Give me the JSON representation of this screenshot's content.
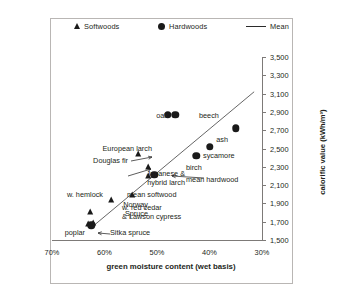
{
  "legend": {
    "items": [
      {
        "label": "Softwoods",
        "marker": "triangle-icon"
      },
      {
        "label": "Hardwoods",
        "marker": "circle-icon"
      },
      {
        "label": "Mean",
        "marker": "line-icon"
      }
    ]
  },
  "chart_data": {
    "type": "scatter",
    "title": "",
    "xlabel": "green moisture content (wet basis)",
    "ylabel": "calorific value (kWh/m³)",
    "xlim": [
      70,
      30
    ],
    "ylim": [
      1500,
      3500
    ],
    "x_ticks": [
      "70%",
      "60%",
      "50%",
      "40%",
      "30%"
    ],
    "x_tick_values": [
      70,
      60,
      50,
      40,
      30
    ],
    "y_ticks": [
      "1,500",
      "1,700",
      "1,900",
      "2,100",
      "2,300",
      "2,500",
      "2,700",
      "2,900",
      "3,100",
      "3,300",
      "3,500"
    ],
    "y_tick_values": [
      1500,
      1700,
      1900,
      2100,
      2300,
      2500,
      2700,
      2900,
      3100,
      3300,
      3500
    ],
    "grid": false,
    "legend_position": "top",
    "series": [
      {
        "name": "Softwoods",
        "marker": "triangle",
        "points": [
          {
            "label": "European larch",
            "x": 53.5,
            "y": 2430
          },
          {
            "label": "Douglas fir",
            "x": 51.5,
            "y": 2290
          },
          {
            "label": "Japanese & hybrid larch",
            "x": 51.5,
            "y": 2190
          },
          {
            "label": "mean softwood",
            "x": 54.5,
            "y": 1980
          },
          {
            "label": "w. hemlock",
            "x": 58.5,
            "y": 1930
          },
          {
            "label": "Norway Spruce",
            "x": 62.5,
            "y": 1800
          },
          {
            "label": "Sitka spruce",
            "x": 62.0,
            "y": 1680
          },
          {
            "label": "w. red cedar & Lawson cypress",
            "x": 63.0,
            "y": 1660
          }
        ]
      },
      {
        "name": "Hardwoods",
        "marker": "circle",
        "points": [
          {
            "label": "oak",
            "x": 48.0,
            "y": 2870
          },
          {
            "label": "beech",
            "x": 46.5,
            "y": 2870
          },
          {
            "label": "ash",
            "x": 35.0,
            "y": 2720
          },
          {
            "label": "sycamore",
            "x": 40.0,
            "y": 2520
          },
          {
            "label": "birch",
            "x": 42.5,
            "y": 2420
          },
          {
            "label": "mean hardwood",
            "x": 50.5,
            "y": 2210
          },
          {
            "label": "poplar",
            "x": 62.5,
            "y": 1660
          }
        ]
      },
      {
        "name": "Mean",
        "marker": "line",
        "line": [
          {
            "x": 62.0,
            "y": 1660
          },
          {
            "x": 31.5,
            "y": 3120
          }
        ]
      }
    ],
    "annotations": [
      "oak",
      "beech",
      "ash",
      "sycamore",
      "birch",
      "mean hardwood",
      "European larch",
      "Douglas fir",
      "Japanese & hybrid larch",
      "mean softwood",
      "w. hemlock",
      "Norway Spruce",
      "poplar",
      "Sitka spruce",
      "w. red cedar & Lawson cypress"
    ]
  }
}
